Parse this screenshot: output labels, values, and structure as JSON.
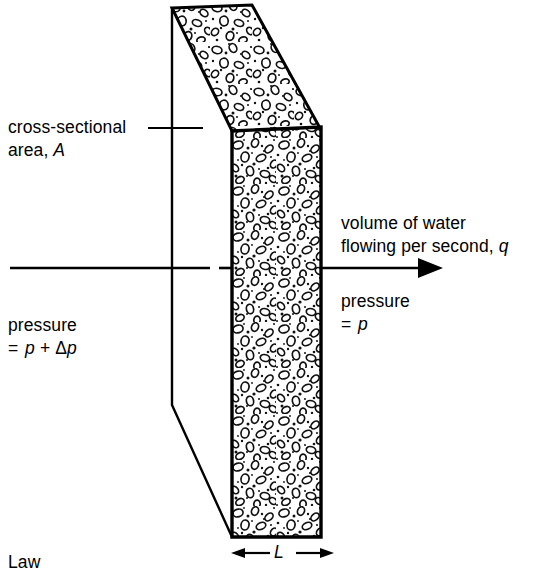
{
  "figure": {
    "labels": {
      "cross_section_line1": "cross-sectional",
      "cross_section_line2_prefix": "area, ",
      "cross_section_symbol": "A",
      "volume_line1": "volume of water",
      "volume_line2_prefix": "flowing per second, ",
      "volume_symbol": "q",
      "pressure_right_line1": "pressure",
      "pressure_right_line2_eq": "= ",
      "pressure_right_symbol": "p",
      "pressure_left_line1": "pressure",
      "pressure_left_line2_eq": "= ",
      "pressure_left_symbol_1": "p",
      "pressure_left_plus": " + ",
      "pressure_left_delta": "Δ",
      "pressure_left_symbol_2": "p",
      "length_symbol": "L",
      "caption": "Law"
    },
    "colors": {
      "ink": "#000000",
      "background": "#ffffff",
      "texture_fill": "#ffffff"
    },
    "geometry": {
      "top_face": "172,8 252,5 320,128 232,131",
      "front_face": "232,131 321,127 321,537 232,537",
      "leader_line_y": 128,
      "leader_line_x_start": 148,
      "leader_line_x_end": 203,
      "vertical_edge_x": 172,
      "vertical_edge_y_top": 8,
      "vertical_edge_y_bend": 405,
      "flow_arrow_y": 268,
      "flow_arrow_x_start": 10,
      "flow_arrow_x_end": 443,
      "flow_arrow_gap_start": 210,
      "flow_arrow_gap_end": 226,
      "length_arrow_y": 553,
      "length_arrow_left": 233,
      "length_arrow_right": 333
    }
  }
}
